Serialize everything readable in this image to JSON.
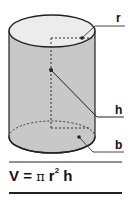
{
  "diagram": {
    "labels": {
      "radius": "r",
      "height": "h",
      "base": "b"
    },
    "formula": {
      "lhs": "V",
      "equals": "=",
      "pi": "π",
      "r": "r",
      "exponent": "2",
      "h": "h"
    },
    "colors": {
      "side_fill": "#c8c8c8",
      "top_fill": "#ececec",
      "stroke": "#222222"
    }
  }
}
